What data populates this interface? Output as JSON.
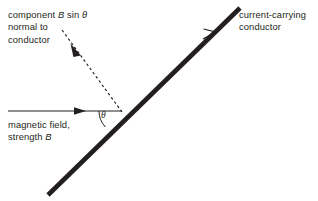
{
  "figure": {
    "background_color": "#ffffff",
    "ink_color": "#231f20"
  },
  "labels": {
    "component_line1_pre": "component ",
    "component_line1_b": "B",
    "component_line1_mid": " sin ",
    "component_line1_theta": "θ",
    "component_line2": "normal to",
    "component_line3": "conductor",
    "field_line1": "magnetic field,",
    "field_line2_pre": "strength ",
    "field_line2_b": "B",
    "conductor_line1": "current-carrying",
    "conductor_line2": "conductor",
    "angle_symbol": "θ"
  },
  "geometry": {
    "conductor": {
      "x1": 48,
      "y1": 195,
      "x2": 240,
      "y2": 8,
      "stroke_width": 4.6,
      "color": "#231f20",
      "arrow_at": {
        "x": 212,
        "y": 35
      },
      "label": "current-carrying conductor"
    },
    "field_arrow": {
      "x1": 8,
      "y1": 111,
      "x2": 122,
      "y2": 111,
      "stroke_width": 1.15,
      "color": "#231f20",
      "arrowhead_tip_x": 86,
      "label": "magnetic field, strength B"
    },
    "normal_component": {
      "x1": 122,
      "y1": 112,
      "x2": 62,
      "y2": 30,
      "stroke_width": 1.15,
      "dash": "2.6 2.6",
      "color": "#231f20",
      "arrow_at": {
        "x": 76,
        "y": 52
      },
      "label": "component B sin theta normal to conductor"
    },
    "angle_arc": {
      "vertex_x": 122,
      "vertex_y": 111,
      "radius": 23,
      "from_degrees": 180,
      "to_degrees": 224,
      "value_label": "θ"
    }
  }
}
